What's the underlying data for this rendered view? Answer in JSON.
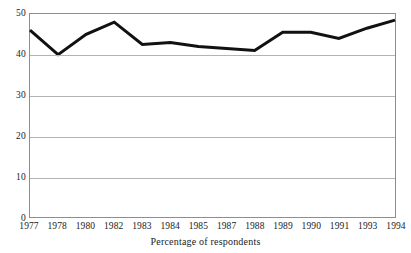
{
  "chart_data": {
    "type": "line",
    "title": "",
    "subtitle": "",
    "xlabel": "Percentage of respondents",
    "ylabel": "",
    "categories": [
      "1977",
      "1978",
      "1980",
      "1982",
      "1983",
      "1984",
      "1985",
      "1987",
      "1988",
      "1989",
      "1990",
      "1991",
      "1993",
      "1994"
    ],
    "values": [
      46,
      40,
      45,
      48,
      42.5,
      43,
      42,
      41.5,
      41,
      45.5,
      45.5,
      44,
      46.5,
      48.5
    ],
    "series": [
      {
        "name": "Percentage of respondents",
        "values": [
          46,
          40,
          45,
          48,
          42.5,
          43,
          42,
          41.5,
          41,
          45.5,
          45.5,
          44,
          46.5,
          48.5
        ]
      }
    ],
    "ylim": [
      0,
      50
    ],
    "yticks": [
      0,
      10,
      20,
      30,
      40,
      50
    ],
    "ytick_labels": [
      "0",
      "10",
      "20",
      "30",
      "40",
      "50"
    ],
    "grid": true,
    "grid_axis": "y",
    "legend": false,
    "legend_position": "none",
    "line_color": "#111111",
    "grid_color": "#b4b4b4",
    "frame_color": "#8e8e8e",
    "background_color": "#ffffff",
    "line_width": 3
  },
  "axes": {
    "y": {
      "ticks": [
        {
          "label": "50",
          "value": 50
        },
        {
          "label": "40",
          "value": 40
        },
        {
          "label": "30",
          "value": 30
        },
        {
          "label": "20",
          "value": 20
        },
        {
          "label": "10",
          "value": 10
        },
        {
          "label": "0",
          "value": 0
        }
      ]
    },
    "x": {
      "ticks": [
        {
          "label": "1977"
        },
        {
          "label": "1978"
        },
        {
          "label": "1980"
        },
        {
          "label": "1982"
        },
        {
          "label": "1983"
        },
        {
          "label": "1984"
        },
        {
          "label": "1985"
        },
        {
          "label": "1987"
        },
        {
          "label": "1988"
        },
        {
          "label": "1989"
        },
        {
          "label": "1990"
        },
        {
          "label": "1991"
        },
        {
          "label": "1993"
        },
        {
          "label": "1994"
        }
      ]
    }
  },
  "caption": {
    "text": "Percentage of respondents"
  }
}
